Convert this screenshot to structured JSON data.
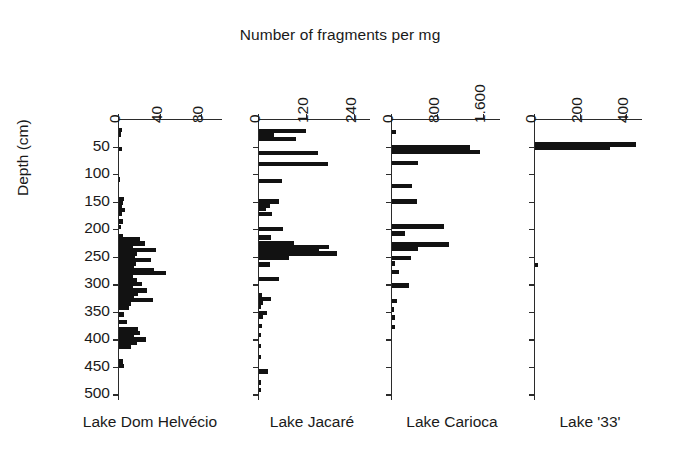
{
  "chart_data": {
    "type": "bar",
    "title": "Number of fragments per mg",
    "xlabel": "Number of fragments per mg",
    "ylabel": "Depth (cm)",
    "orientation": "horizontal",
    "ylim": [
      0,
      510
    ],
    "yticks": [
      50,
      100,
      150,
      200,
      250,
      300,
      350,
      400,
      450,
      500
    ],
    "ytick_labels": [
      "50",
      "100",
      "150",
      "200",
      "250",
      "300",
      "350",
      "400",
      "450",
      "500"
    ],
    "grid": false,
    "legend": "none",
    "panels": [
      {
        "name": "Lake Dom Helvécio",
        "xlim": [
          0,
          100
        ],
        "xticks": [
          0,
          40,
          80
        ],
        "xtick_labels": [
          "0",
          "40",
          "80"
        ],
        "bars": [
          {
            "depth": 20,
            "value": 3
          },
          {
            "depth": 28,
            "value": 2
          },
          {
            "depth": 55,
            "value": 3
          },
          {
            "depth": 110,
            "value": 1
          },
          {
            "depth": 145,
            "value": 5
          },
          {
            "depth": 152,
            "value": 4
          },
          {
            "depth": 158,
            "value": 3
          },
          {
            "depth": 165,
            "value": 6
          },
          {
            "depth": 172,
            "value": 3
          },
          {
            "depth": 186,
            "value": 4
          },
          {
            "depth": 196,
            "value": 2
          },
          {
            "depth": 212,
            "value": 4
          },
          {
            "depth": 219,
            "value": 20
          },
          {
            "depth": 226,
            "value": 25
          },
          {
            "depth": 232,
            "value": 13
          },
          {
            "depth": 238,
            "value": 36
          },
          {
            "depth": 244,
            "value": 17
          },
          {
            "depth": 250,
            "value": 15
          },
          {
            "depth": 256,
            "value": 31
          },
          {
            "depth": 262,
            "value": 16
          },
          {
            "depth": 268,
            "value": 14
          },
          {
            "depth": 274,
            "value": 34
          },
          {
            "depth": 280,
            "value": 45
          },
          {
            "depth": 287,
            "value": 13
          },
          {
            "depth": 293,
            "value": 17
          },
          {
            "depth": 299,
            "value": 22
          },
          {
            "depth": 305,
            "value": 13
          },
          {
            "depth": 311,
            "value": 27
          },
          {
            "depth": 317,
            "value": 18
          },
          {
            "depth": 323,
            "value": 14
          },
          {
            "depth": 329,
            "value": 33
          },
          {
            "depth": 336,
            "value": 12
          },
          {
            "depth": 342,
            "value": 10
          },
          {
            "depth": 355,
            "value": 5
          },
          {
            "depth": 368,
            "value": 8
          },
          {
            "depth": 381,
            "value": 18
          },
          {
            "depth": 388,
            "value": 20
          },
          {
            "depth": 394,
            "value": 14
          },
          {
            "depth": 400,
            "value": 26
          },
          {
            "depth": 407,
            "value": 17
          },
          {
            "depth": 413,
            "value": 12
          },
          {
            "depth": 440,
            "value": 4
          },
          {
            "depth": 448,
            "value": 5
          }
        ]
      },
      {
        "name": "Lake Jacaré",
        "xlim": [
          0,
          280
        ],
        "xticks": [
          0,
          120,
          240
        ],
        "xtick_labels": [
          "0",
          "120",
          "240"
        ],
        "bars": [
          {
            "depth": 22,
            "value": 118
          },
          {
            "depth": 29,
            "value": 38
          },
          {
            "depth": 36,
            "value": 92
          },
          {
            "depth": 62,
            "value": 148
          },
          {
            "depth": 82,
            "value": 173
          },
          {
            "depth": 112,
            "value": 57
          },
          {
            "depth": 150,
            "value": 50
          },
          {
            "depth": 157,
            "value": 28
          },
          {
            "depth": 163,
            "value": 18
          },
          {
            "depth": 172,
            "value": 33
          },
          {
            "depth": 200,
            "value": 60
          },
          {
            "depth": 215,
            "value": 30
          },
          {
            "depth": 226,
            "value": 88
          },
          {
            "depth": 232,
            "value": 175
          },
          {
            "depth": 238,
            "value": 150
          },
          {
            "depth": 244,
            "value": 195
          },
          {
            "depth": 252,
            "value": 75
          },
          {
            "depth": 264,
            "value": 28
          },
          {
            "depth": 290,
            "value": 50
          },
          {
            "depth": 320,
            "value": 8
          },
          {
            "depth": 327,
            "value": 30
          },
          {
            "depth": 334,
            "value": 10
          },
          {
            "depth": 341,
            "value": 6
          },
          {
            "depth": 352,
            "value": 20
          },
          {
            "depth": 359,
            "value": 9
          },
          {
            "depth": 376,
            "value": 7
          },
          {
            "depth": 392,
            "value": 5
          },
          {
            "depth": 412,
            "value": 5
          },
          {
            "depth": 432,
            "value": 4
          },
          {
            "depth": 458,
            "value": 22
          },
          {
            "depth": 478,
            "value": 4
          },
          {
            "depth": 492,
            "value": 4
          }
        ]
      },
      {
        "name": "Lake Carioca",
        "xlim": [
          0,
          1900
        ],
        "xticks": [
          0,
          800,
          1600
        ],
        "xtick_labels": [
          "0",
          "800",
          "1.600"
        ],
        "bars": [
          {
            "depth": 24,
            "value": 70
          },
          {
            "depth": 52,
            "value": 1360
          },
          {
            "depth": 60,
            "value": 1540
          },
          {
            "depth": 80,
            "value": 460
          },
          {
            "depth": 122,
            "value": 350
          },
          {
            "depth": 150,
            "value": 430
          },
          {
            "depth": 195,
            "value": 900
          },
          {
            "depth": 208,
            "value": 230
          },
          {
            "depth": 228,
            "value": 1000
          },
          {
            "depth": 236,
            "value": 450
          },
          {
            "depth": 252,
            "value": 330
          },
          {
            "depth": 262,
            "value": 60
          },
          {
            "depth": 278,
            "value": 130
          },
          {
            "depth": 302,
            "value": 290
          },
          {
            "depth": 330,
            "value": 90
          },
          {
            "depth": 346,
            "value": 40
          },
          {
            "depth": 360,
            "value": 45
          },
          {
            "depth": 378,
            "value": 50
          }
        ]
      },
      {
        "name": "Lake '33'",
        "xlim": [
          0,
          470
        ],
        "xticks": [
          0,
          200,
          400
        ],
        "xtick_labels": [
          "0",
          "200",
          "400"
        ],
        "bars": [
          {
            "depth": 46,
            "value": 440
          },
          {
            "depth": 53,
            "value": 325
          },
          {
            "depth": 265,
            "value": 12
          }
        ]
      }
    ]
  },
  "geometry": {
    "plot_top": 119,
    "plot_bottom": 400,
    "depth_max": 510,
    "panels": [
      {
        "left": 118,
        "width": 104
      },
      {
        "left": 258,
        "width": 112
      },
      {
        "left": 391,
        "width": 109
      },
      {
        "left": 534,
        "width": 108
      }
    ],
    "caption_positions": [
      60,
      242,
      382,
      520
    ],
    "caption_widths": [
      180,
      140,
      140,
      140
    ]
  },
  "colors": {
    "bar": "#121212",
    "axis": "#2b2b2b",
    "text": "#1a1a1a",
    "background": "#ffffff"
  }
}
